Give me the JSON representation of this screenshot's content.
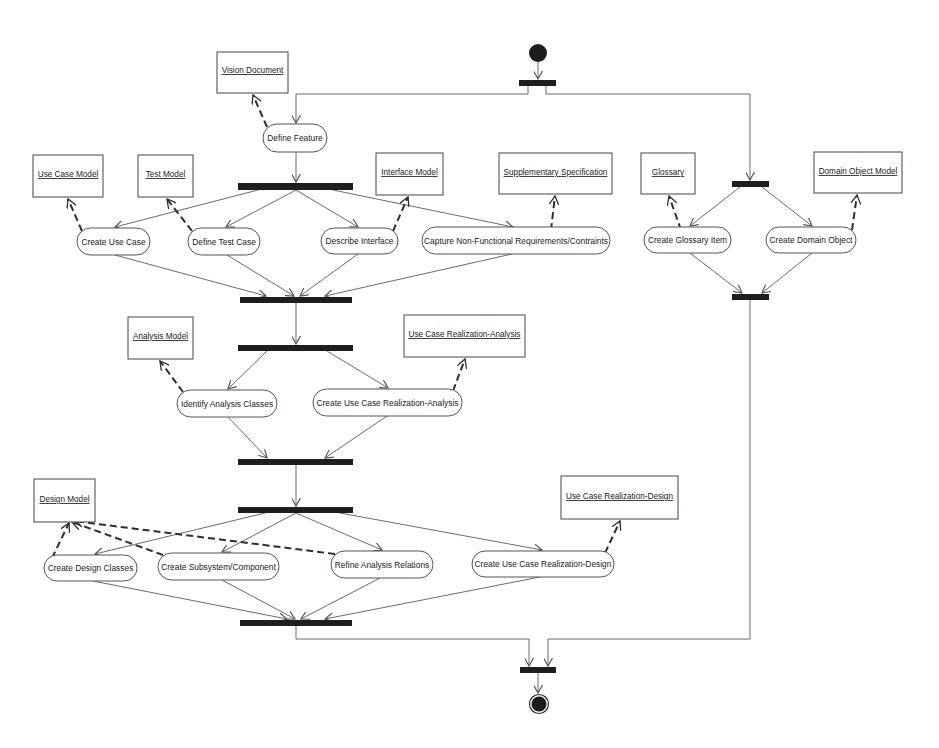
{
  "diagram": {
    "kind": "UML activity diagram",
    "colors": {
      "background": "#ffffff",
      "flow_line": "#6b6b6b",
      "dependency_line": "#2e2e2e",
      "sync_bar": "#1e1e1e",
      "node_border": "#555555",
      "text": "#222222"
    },
    "activities": [
      "Define Feature",
      "Create Use Case",
      "Define Test Case",
      "Describe Interface",
      "Capture Non-Functional Requirements/Contraints",
      "Create Glossary Item",
      "Create Domain Object",
      "Identify Analysis Classes",
      "Create Use Case Realization-Analysis",
      "Create Design Classes",
      "Create Subsystem/Component",
      "Refine Analysis Relations",
      "Create Use Case Realization-Design"
    ],
    "artifacts": [
      "Vision Document",
      "Use Case Model",
      "Test Model",
      "Interface Model",
      "Supplementary Specification",
      "Glossary",
      "Domain Object Model",
      "Analysis Model",
      "Use Case Realization-Analysis",
      "Design Model",
      "Use Case Realization-Design"
    ],
    "dependencies": [
      {
        "from": "Define Feature",
        "to": "Vision Document"
      },
      {
        "from": "Create Use Case",
        "to": "Use Case Model"
      },
      {
        "from": "Define Test Case",
        "to": "Test Model"
      },
      {
        "from": "Describe Interface",
        "to": "Interface Model"
      },
      {
        "from": "Capture Non-Functional Requirements/Contraints",
        "to": "Supplementary Specification"
      },
      {
        "from": "Create Glossary Item",
        "to": "Glossary"
      },
      {
        "from": "Create Domain Object",
        "to": "Domain Object Model"
      },
      {
        "from": "Identify Analysis Classes",
        "to": "Analysis Model"
      },
      {
        "from": "Create Use Case Realization-Analysis",
        "to": "Use Case Realization-Analysis"
      },
      {
        "from": "Create Design Classes",
        "to": "Design Model"
      },
      {
        "from": "Create Subsystem/Component",
        "to": "Design Model"
      },
      {
        "from": "Refine Analysis Relations",
        "to": "Design Model"
      },
      {
        "from": "Create Use Case Realization-Design",
        "to": "Use Case Realization-Design"
      }
    ],
    "flow_stages": [
      {
        "fork": "start",
        "branches": [
          "left-branch",
          "right-branch"
        ]
      },
      {
        "stage": 1,
        "activities": [
          "Define Feature"
        ]
      },
      {
        "stage": 2,
        "parallel": [
          "Create Use Case",
          "Define Test Case",
          "Describe Interface",
          "Capture Non-Functional Requirements/Contraints"
        ]
      },
      {
        "stage": 3,
        "parallel": [
          "Identify Analysis Classes",
          "Create Use Case Realization-Analysis"
        ]
      },
      {
        "stage": 4,
        "parallel": [
          "Create Design Classes",
          "Create Subsystem/Component",
          "Refine Analysis Relations",
          "Create Use Case Realization-Design"
        ]
      },
      {
        "right_branch": [
          "Create Glossary Item",
          "Create Domain Object"
        ]
      },
      {
        "join": "final",
        "then": "end"
      }
    ]
  }
}
